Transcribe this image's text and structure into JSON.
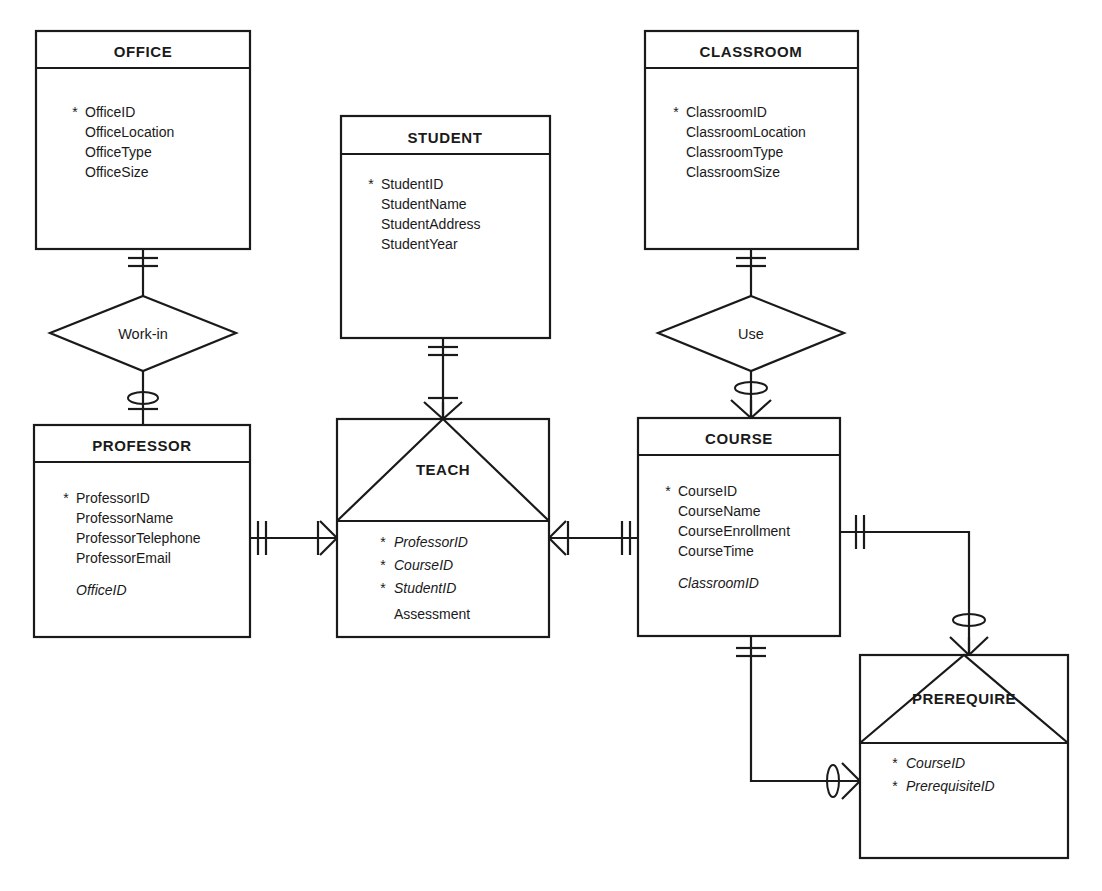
{
  "diagram": {
    "type": "entity-relationship-diagram",
    "notation": "crow's-foot",
    "key_marker": "*"
  },
  "entities": [
    {
      "id": "office",
      "name": "OFFICE",
      "attributes": [
        {
          "label": "OfficeID",
          "key": true,
          "foreign": false
        },
        {
          "label": "OfficeLocation",
          "key": false,
          "foreign": false
        },
        {
          "label": "OfficeType",
          "key": false,
          "foreign": false
        },
        {
          "label": "OfficeSize",
          "key": false,
          "foreign": false
        }
      ]
    },
    {
      "id": "student",
      "name": "STUDENT",
      "attributes": [
        {
          "label": "StudentID",
          "key": true,
          "foreign": false
        },
        {
          "label": "StudentName",
          "key": false,
          "foreign": false
        },
        {
          "label": "StudentAddress",
          "key": false,
          "foreign": false
        },
        {
          "label": "StudentYear",
          "key": false,
          "foreign": false
        }
      ]
    },
    {
      "id": "classroom",
      "name": "CLASSROOM",
      "attributes": [
        {
          "label": "ClassroomID",
          "key": true,
          "foreign": false
        },
        {
          "label": "ClassroomLocation",
          "key": false,
          "foreign": false
        },
        {
          "label": "ClassroomType",
          "key": false,
          "foreign": false
        },
        {
          "label": "ClassroomSize",
          "key": false,
          "foreign": false
        }
      ]
    },
    {
      "id": "professor",
      "name": "PROFESSOR",
      "attributes": [
        {
          "label": "ProfessorID",
          "key": true,
          "foreign": false
        },
        {
          "label": "ProfessorName",
          "key": false,
          "foreign": false
        },
        {
          "label": "ProfessorTelephone",
          "key": false,
          "foreign": false
        },
        {
          "label": "ProfessorEmail",
          "key": false,
          "foreign": false
        },
        {
          "label": "OfficeID",
          "key": false,
          "foreign": true
        }
      ]
    },
    {
      "id": "course",
      "name": "COURSE",
      "attributes": [
        {
          "label": "CourseID",
          "key": true,
          "foreign": false
        },
        {
          "label": "CourseName",
          "key": false,
          "foreign": false
        },
        {
          "label": "CourseEnrollment",
          "key": false,
          "foreign": false
        },
        {
          "label": "CourseTime",
          "key": false,
          "foreign": false
        },
        {
          "label": "ClassroomID",
          "key": false,
          "foreign": true
        }
      ]
    }
  ],
  "associative_entities": [
    {
      "id": "teach",
      "name": "TEACH",
      "attributes": [
        {
          "label": "ProfessorID",
          "key": true,
          "foreign": true
        },
        {
          "label": "CourseID",
          "key": true,
          "foreign": true
        },
        {
          "label": "StudentID",
          "key": true,
          "foreign": true
        },
        {
          "label": "Assessment",
          "key": false,
          "foreign": false
        }
      ]
    },
    {
      "id": "prerequire",
      "name": "PREREQUIRE",
      "attributes": [
        {
          "label": "CourseID",
          "key": true,
          "foreign": true
        },
        {
          "label": "PrerequisiteID",
          "key": true,
          "foreign": true
        }
      ]
    }
  ],
  "relationships": [
    {
      "id": "work-in",
      "name": "Work-in",
      "from": "OFFICE",
      "to": "PROFESSOR",
      "from_cardinality": "one-and-only-one",
      "to_cardinality": "zero-or-one"
    },
    {
      "id": "use",
      "name": "Use",
      "from": "CLASSROOM",
      "to": "COURSE",
      "from_cardinality": "one-and-only-one",
      "to_cardinality": "zero-or-many"
    },
    {
      "id": "teach-professor",
      "name": "TEACH",
      "from": "PROFESSOR",
      "to": "TEACH",
      "from_cardinality": "one-and-only-one",
      "to_cardinality": "one-or-many"
    },
    {
      "id": "teach-course",
      "name": "TEACH",
      "from": "TEACH",
      "to": "COURSE",
      "from_cardinality": "one-or-many",
      "to_cardinality": "one-and-only-one"
    },
    {
      "id": "teach-student",
      "name": "TEACH",
      "from": "STUDENT",
      "to": "TEACH",
      "from_cardinality": "one-and-only-one",
      "to_cardinality": "one-or-many"
    },
    {
      "id": "prerequire-course-top",
      "name": "PREREQUIRE",
      "from": "COURSE",
      "to": "PREREQUIRE",
      "from_cardinality": "one-and-only-one",
      "to_cardinality": "zero-or-many"
    },
    {
      "id": "prerequire-course-bottom",
      "name": "PREREQUIRE",
      "from": "COURSE",
      "to": "PREREQUIRE",
      "from_cardinality": "one-and-only-one",
      "to_cardinality": "zero-or-many"
    }
  ]
}
